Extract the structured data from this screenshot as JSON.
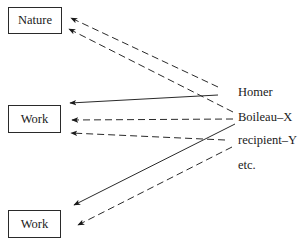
{
  "diagram": {
    "boxes": [
      {
        "id": "nature",
        "label": "Nature",
        "x": 8,
        "y": 7,
        "w": 54,
        "h": 27
      },
      {
        "id": "work-1",
        "label": "Work",
        "x": 8,
        "y": 105,
        "w": 53,
        "h": 28
      },
      {
        "id": "work-2",
        "label": "Work",
        "x": 8,
        "y": 210,
        "w": 53,
        "h": 28
      }
    ],
    "labels": [
      {
        "id": "homer",
        "text": "Homer",
        "x": 238,
        "y": 85
      },
      {
        "id": "boileau",
        "text": "Boileau–X",
        "x": 238,
        "y": 110
      },
      {
        "id": "recipient",
        "text": "recipient–Y",
        "x": 238,
        "y": 133
      },
      {
        "id": "etc",
        "text": "etc.",
        "x": 238,
        "y": 158
      }
    ],
    "arrows": [
      {
        "from": "homer-area",
        "to": "nature",
        "style": "dashed",
        "x1": 218,
        "y1": 87,
        "x2": 71,
        "y2": 18
      },
      {
        "from": "boileau-area",
        "to": "nature",
        "style": "dashed",
        "x1": 233,
        "y1": 112,
        "x2": 69,
        "y2": 29
      },
      {
        "from": "homer-area",
        "to": "work-1",
        "style": "solid",
        "x1": 218,
        "y1": 95,
        "x2": 70,
        "y2": 103
      },
      {
        "from": "boileau-area",
        "to": "work-1",
        "style": "dashed",
        "x1": 233,
        "y1": 119,
        "x2": 72,
        "y2": 120
      },
      {
        "from": "recipient-area",
        "to": "work-1",
        "style": "dashed",
        "x1": 225,
        "y1": 140,
        "x2": 71,
        "y2": 133
      },
      {
        "from": "boileau-area",
        "to": "work-2",
        "style": "solid",
        "x1": 235,
        "y1": 124,
        "x2": 74,
        "y2": 205
      },
      {
        "from": "recipient-area",
        "to": "work-2",
        "style": "dashed",
        "x1": 232,
        "y1": 147,
        "x2": 78,
        "y2": 225
      }
    ],
    "colors": {
      "line": "#2a2a2a",
      "text": "#1a1a1a",
      "background": "#ffffff"
    }
  }
}
